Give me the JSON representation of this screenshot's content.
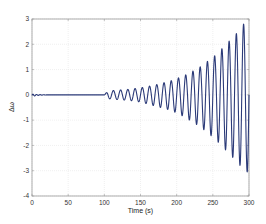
{
  "chart_data": {
    "type": "line",
    "title": "",
    "xlabel": "Time (s)",
    "ylabel": "Δω",
    "xlim": [
      0,
      300
    ],
    "ylim": [
      -4,
      3
    ],
    "xticks": [
      0,
      50,
      100,
      150,
      200,
      250,
      300
    ],
    "yticks": [
      -4,
      -3,
      -2,
      -1,
      0,
      1,
      2,
      3
    ],
    "grid": true,
    "legend": null,
    "series": [
      {
        "name": "Δω",
        "color": "#2b3a78",
        "description": "Near zero with small damped ripple 0–20 s, flat 20–100 s, then growing sinusoidal oscillation (period ≈ 10 s) from 100 s to 300 s with exponentially increasing amplitude",
        "segments": [
          {
            "t_start": 0,
            "t_end": 20,
            "kind": "damped_ripple",
            "amplitude": 0.05,
            "period": 5
          },
          {
            "t_start": 20,
            "t_end": 100,
            "kind": "flat",
            "value": 0
          },
          {
            "t_start": 100,
            "t_end": 300,
            "kind": "growing_oscillation",
            "period": 10,
            "amplitude_start": 0.15,
            "amplitude_end": 3.0
          }
        ],
        "peaks": {
          "t": [
            105,
            115,
            125,
            135,
            145,
            155,
            165,
            175,
            185,
            195,
            205,
            215,
            225,
            235,
            245,
            255,
            265,
            275,
            285,
            295
          ],
          "max": [
            0.15,
            0.18,
            0.2,
            0.22,
            0.26,
            0.3,
            0.36,
            0.42,
            0.5,
            0.58,
            0.7,
            0.82,
            0.98,
            1.15,
            1.38,
            1.6,
            1.9,
            2.2,
            2.5,
            2.9
          ],
          "min": [
            -0.15,
            -0.18,
            -0.2,
            -0.22,
            -0.26,
            -0.32,
            -0.4,
            -0.48,
            -0.55,
            -0.65,
            -0.78,
            -0.95,
            -1.12,
            -1.32,
            -1.55,
            -1.8,
            -2.1,
            -2.4,
            -2.7,
            -3.05
          ]
        }
      }
    ]
  },
  "axes": {
    "x_tick_labels": [
      "0",
      "50",
      "100",
      "150",
      "200",
      "250",
      "300"
    ],
    "y_tick_labels": [
      "-4",
      "-3",
      "-2",
      "-1",
      "0",
      "1",
      "2",
      "3"
    ],
    "xlabel": "Time (s)",
    "ylabel": "Δω"
  }
}
